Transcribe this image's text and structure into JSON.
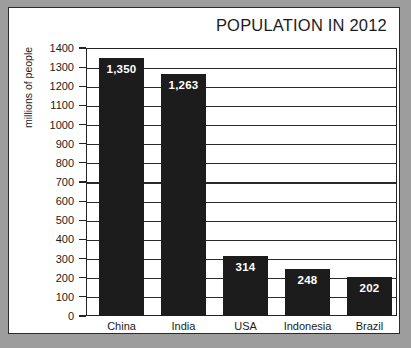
{
  "chart_data": {
    "type": "bar",
    "title": "POPULATION IN 2012",
    "xlabel": "",
    "ylabel": "millions of people",
    "categories": [
      "China",
      "India",
      "USA",
      "Indonesia",
      "Brazil"
    ],
    "values": [
      1350,
      1263,
      314,
      248,
      202
    ],
    "value_labels": [
      "1,350",
      "1,263",
      "314",
      "248",
      "202"
    ],
    "ylim": [
      0,
      1400
    ],
    "ytick_step": 100,
    "yticks": [
      1400,
      1300,
      1200,
      1100,
      1000,
      900,
      800,
      700,
      600,
      500,
      400,
      300,
      200,
      100,
      0
    ],
    "grid": true,
    "legend": false,
    "bar_color": "#1c1c1c",
    "label_color": "#ffffff",
    "axis_color": "#232323",
    "background": "#ffffff",
    "page_background": "#9d9d9d"
  }
}
